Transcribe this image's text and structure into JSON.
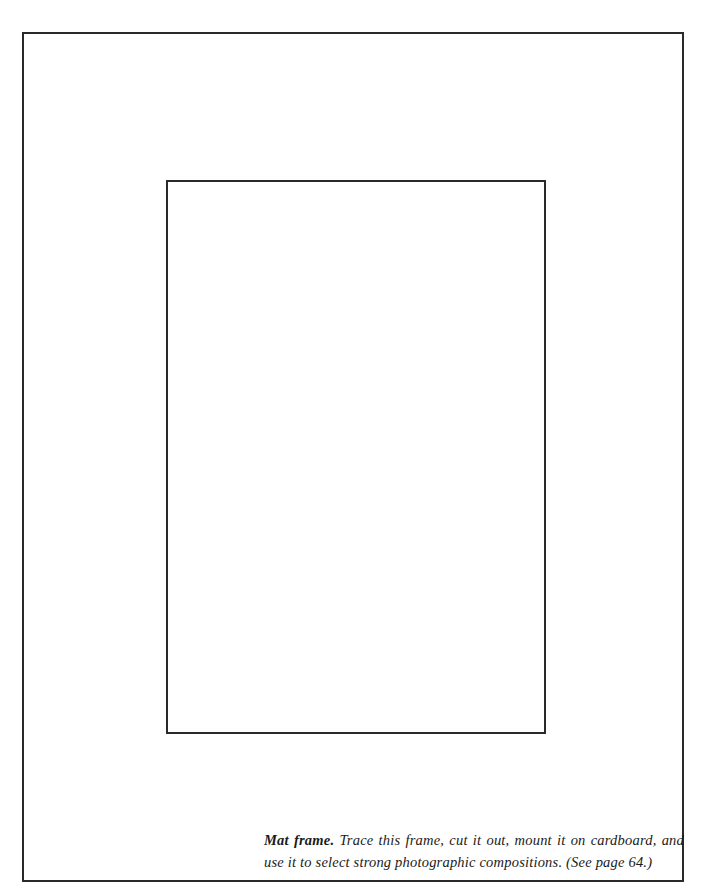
{
  "caption": {
    "title": "Mat frame.",
    "text": " Trace this frame, cut it out, mount it on cardboard, and use it to select strong photographic compositions. (See page 64.)"
  },
  "colors": {
    "frame_line": "#2a2a2a",
    "background": "#ffffff"
  }
}
